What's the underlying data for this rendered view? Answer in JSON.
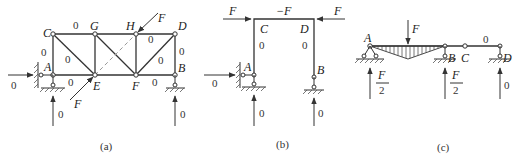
{
  "figures": [
    {
      "id": "a",
      "caption": "(a)",
      "nodes": {
        "A": "A",
        "B": "B",
        "C": "C",
        "D": "D",
        "E": "E",
        "F": "F",
        "G": "G",
        "H": "H"
      },
      "member_forces": {
        "CG": "0",
        "AC": "0",
        "CE": "0",
        "AE": "0",
        "HD": "0",
        "HF_diag_FD": "0",
        "DB": "0",
        "FB": "0"
      },
      "loads": {
        "at_H": "F",
        "at_E": "F"
      },
      "reactions": {
        "A_horizontal": "0",
        "A_vertical": "0",
        "B_vertical": "0"
      }
    },
    {
      "id": "b",
      "caption": "(b)",
      "nodes": {
        "A": "A",
        "B": "B",
        "C": "C",
        "D": "D"
      },
      "loads": {
        "left": "F",
        "right": "F"
      },
      "member_forces": {
        "CD": "−F",
        "AC": "0",
        "DB": "0"
      },
      "reactions": {
        "A_horizontal": "0",
        "A_vertical": "0",
        "B_vertical": "0"
      }
    },
    {
      "id": "c",
      "caption": "(c)",
      "nodes": {
        "A": "A",
        "B": "B",
        "C": "C",
        "D": "D"
      },
      "loads": {
        "midspan_AB": "F"
      },
      "member_forces": {
        "CD": "0"
      },
      "reactions": {
        "A_vertical": {
          "num": "F",
          "den": "2"
        },
        "B_vertical": {
          "num": "F",
          "den": "2"
        },
        "D_vertical": "0"
      }
    }
  ]
}
